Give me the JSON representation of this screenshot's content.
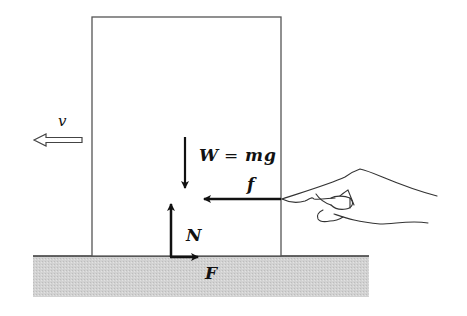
{
  "diagram": {
    "title": "",
    "labels": {
      "velocity": "v",
      "weight_lhs": "W",
      "weight_eq": "=",
      "weight_rhs_m": "m",
      "weight_rhs_g": "g",
      "push_force": "f",
      "normal_force": "N",
      "friction_force": "F"
    },
    "colors": {
      "ground_fill": "#cfcfcf",
      "outline": "#555555",
      "arrow": "#111111"
    }
  }
}
